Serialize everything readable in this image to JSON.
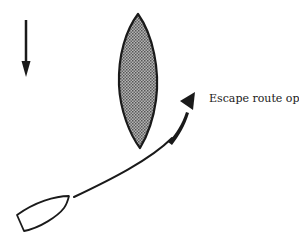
{
  "diagram": {
    "annotation": "Escape route open",
    "colors": {
      "ink": "#1a1a1a",
      "hatch_fill": "#8a8a8a",
      "background": "#ffffff"
    },
    "elements": [
      {
        "name": "wind-arrow",
        "description": "Downward arrow indicating wind/current direction"
      },
      {
        "name": "obstacle-shape",
        "description": "Hatched lens-shaped obstacle"
      },
      {
        "name": "boat-outline",
        "description": "Boat hull outline"
      },
      {
        "name": "escape-route-path",
        "description": "Curved path with arrowhead"
      }
    ]
  }
}
